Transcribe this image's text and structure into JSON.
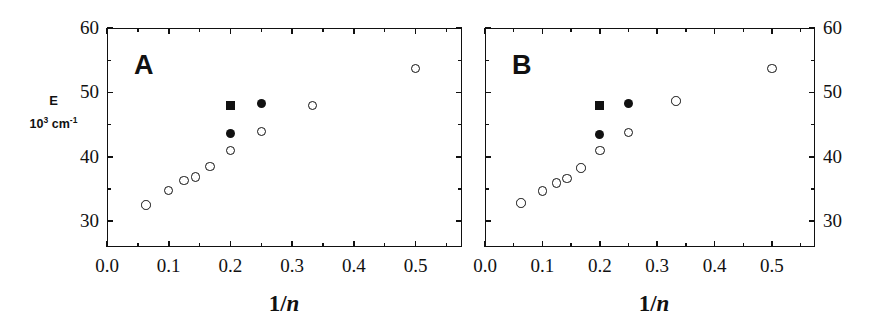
{
  "figure": {
    "axis_color": "#111111",
    "background": "#ffffff"
  },
  "panels": [
    {
      "letter": "A",
      "xlabel_prefix": "1/",
      "xlabel_var": "n",
      "ylabel_line1": "E",
      "ylabel_units_base": "10",
      "ylabel_units_exp": "3",
      "ylabel_units_unit": "cm",
      "ylabel_units_unit_exp": "-1",
      "y_ticks": [
        "60",
        "50",
        "40",
        "30"
      ],
      "x_ticks": [
        "0.0",
        "0.1",
        "0.2",
        "0.3",
        "0.4",
        "0.5"
      ]
    },
    {
      "letter": "B",
      "xlabel_prefix": "1/",
      "xlabel_var": "n",
      "y_ticks": [
        "60",
        "50",
        "40",
        "30"
      ],
      "x_ticks": [
        "0.0",
        "0.1",
        "0.2",
        "0.3",
        "0.4",
        "0.5"
      ]
    }
  ],
  "chart_data": [
    {
      "type": "scatter",
      "title": "A",
      "xlabel": "1/n",
      "ylabel": "E / 10^3 cm^-1",
      "xlim": [
        0.0,
        0.575
      ],
      "ylim": [
        26.0,
        60.0
      ],
      "x_ticks": [
        0.0,
        0.1,
        0.2,
        0.3,
        0.4,
        0.5
      ],
      "y_ticks": [
        30,
        40,
        50,
        60
      ],
      "x_minor_step": 0.05,
      "y_minor_step": 5,
      "grid": false,
      "legend": "none",
      "series": [
        {
          "name": "open circles",
          "marker": "open-circle",
          "points": [
            {
              "x": 0.063,
              "y": 32.5
            },
            {
              "x": 0.1,
              "y": 34.8
            },
            {
              "x": 0.125,
              "y": 36.3
            },
            {
              "x": 0.143,
              "y": 36.9
            },
            {
              "x": 0.167,
              "y": 38.5
            },
            {
              "x": 0.2,
              "y": 41.0
            },
            {
              "x": 0.25,
              "y": 43.9
            },
            {
              "x": 0.333,
              "y": 48.0
            },
            {
              "x": 0.5,
              "y": 53.7
            }
          ]
        },
        {
          "name": "filled circles",
          "marker": "filled-circle",
          "points": [
            {
              "x": 0.2,
              "y": 43.6
            },
            {
              "x": 0.25,
              "y": 48.3
            }
          ]
        },
        {
          "name": "filled square",
          "marker": "filled-square",
          "points": [
            {
              "x": 0.2,
              "y": 47.9
            }
          ]
        }
      ]
    },
    {
      "type": "scatter",
      "title": "B",
      "xlabel": "1/n",
      "ylabel": "E / 10^3 cm^-1",
      "xlim": [
        0.0,
        0.575
      ],
      "ylim": [
        26.0,
        60.0
      ],
      "x_ticks": [
        0.0,
        0.1,
        0.2,
        0.3,
        0.4,
        0.5
      ],
      "y_ticks": [
        30,
        40,
        50,
        60
      ],
      "x_minor_step": 0.05,
      "y_minor_step": 5,
      "grid": false,
      "legend": "none",
      "series": [
        {
          "name": "open circles",
          "marker": "open-circle",
          "points": [
            {
              "x": 0.063,
              "y": 32.8
            },
            {
              "x": 0.1,
              "y": 34.7
            },
            {
              "x": 0.125,
              "y": 35.9
            },
            {
              "x": 0.143,
              "y": 36.6
            },
            {
              "x": 0.167,
              "y": 38.3
            },
            {
              "x": 0.2,
              "y": 41.0
            },
            {
              "x": 0.25,
              "y": 43.8
            },
            {
              "x": 0.333,
              "y": 48.7
            },
            {
              "x": 0.5,
              "y": 53.7
            }
          ]
        },
        {
          "name": "filled circles",
          "marker": "filled-circle",
          "points": [
            {
              "x": 0.2,
              "y": 43.5
            },
            {
              "x": 0.25,
              "y": 48.3
            }
          ]
        },
        {
          "name": "filled square",
          "marker": "filled-square",
          "points": [
            {
              "x": 0.2,
              "y": 48.0
            }
          ]
        }
      ]
    }
  ]
}
